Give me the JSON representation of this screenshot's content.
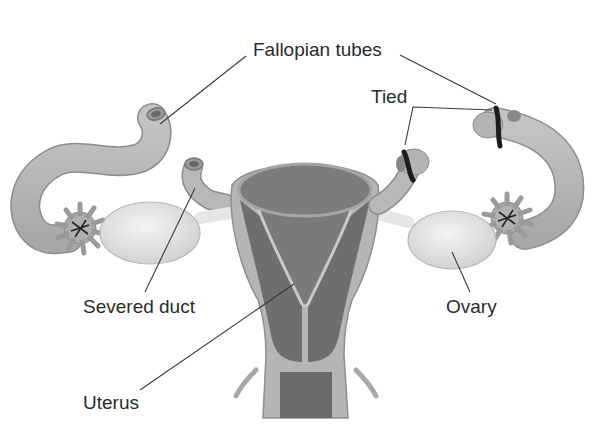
{
  "diagram": {
    "labels": {
      "fallopian_tubes": "Fallopian tubes",
      "tied": "Tied",
      "severed_duct": "Severed duct",
      "ovary": "Ovary",
      "uterus": "Uterus"
    },
    "colors": {
      "background": "#ffffff",
      "tube_fill": "#b9b9b9",
      "tube_stroke": "#8d8d8d",
      "uterus_outer": "#b5b5b5",
      "uterus_inner_dark": "#6e6e6e",
      "uterus_cavity": "#7a7a7a",
      "ovary_fill": "#e3e3e3",
      "tie_band": "#1c1c1c",
      "leader_line": "#3a3a3a",
      "label_text": "#2b2b2b"
    }
  }
}
